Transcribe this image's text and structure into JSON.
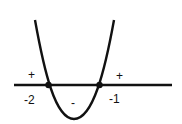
{
  "diagram": {
    "roots": [
      {
        "label": "-2"
      },
      {
        "label": "-1"
      }
    ],
    "regions": [
      {
        "sign": "+",
        "position": "left of -2"
      },
      {
        "sign": "-",
        "position": "between -2 and -1"
      },
      {
        "sign": "+",
        "position": "right of -1"
      }
    ],
    "colors": {
      "stroke": "#111111",
      "background": "#ffffff"
    }
  }
}
